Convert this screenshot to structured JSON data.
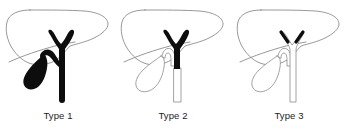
{
  "figure": {
    "background_color": "#ffffff",
    "ink_color": "#0d0d0d",
    "outline_color": "#7d7d7d",
    "panel_count": 3
  },
  "panels": [
    {
      "id": "type-1",
      "caption": "Type 1",
      "filled_parts": [
        "common hepatic duct",
        "right hepatic duct",
        "left hepatic duct",
        "common bile duct",
        "cystic duct",
        "gallbladder"
      ],
      "outline_parts": [
        "liver"
      ],
      "gallbladder_style": "filled",
      "duct_style": "filled"
    },
    {
      "id": "type-2",
      "caption": "Type 2",
      "filled_parts": [
        "common hepatic duct",
        "right hepatic duct",
        "left hepatic duct",
        "upper common bile duct"
      ],
      "outline_parts": [
        "liver",
        "gallbladder",
        "cystic duct",
        "lower common bile duct"
      ],
      "gallbladder_style": "outline",
      "duct_style": "partially-filled"
    },
    {
      "id": "type-3",
      "caption": "Type 3",
      "filled_parts": [
        "right hepatic duct tip",
        "left hepatic duct tip"
      ],
      "outline_parts": [
        "liver",
        "gallbladder",
        "cystic duct",
        "common hepatic duct",
        "common bile duct"
      ],
      "gallbladder_style": "outline",
      "duct_style": "tips-only"
    }
  ]
}
